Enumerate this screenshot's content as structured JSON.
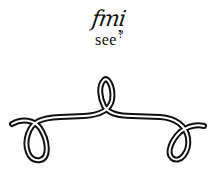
{
  "caption": {
    "word": "fmi",
    "comma": ",",
    "tail": "see",
    "question": "?"
  },
  "ornament": {
    "shape": "rope-loop",
    "stroke_color": "#111111",
    "fill_color": "#ffffff"
  }
}
